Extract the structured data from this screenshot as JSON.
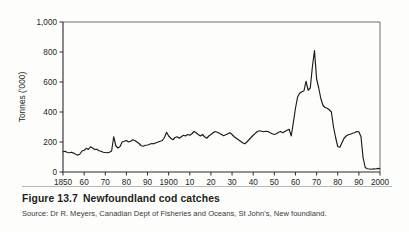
{
  "figure": {
    "number": "Figure 13.7",
    "title": "Newfoundland cod catches",
    "source": "Source: Dr R. Meyers, Canadian Dept of Fisheries and Oceans, St John's, New foundland."
  },
  "chart_data": {
    "type": "line",
    "title": "Newfoundland cod catches",
    "xlabel": "",
    "ylabel": "Tonnes ('000)",
    "xlim": [
      1850,
      2000
    ],
    "ylim": [
      0,
      1000
    ],
    "grid": false,
    "legend": null,
    "x_tick_values": [
      1850,
      1860,
      1870,
      1880,
      1890,
      1900,
      1910,
      1920,
      1930,
      1940,
      1950,
      1960,
      1970,
      1980,
      1990,
      2000
    ],
    "x_tick_labels": [
      "1850",
      "60",
      "70",
      "80",
      "90",
      "1900",
      "10",
      "20",
      "30",
      "40",
      "50",
      "60",
      "70",
      "80",
      "90",
      "2000"
    ],
    "y_tick_values": [
      0,
      200,
      400,
      600,
      800,
      1000
    ],
    "y_tick_labels": [
      "0",
      "200",
      "400",
      "600",
      "800",
      "1,000"
    ],
    "series": [
      {
        "name": "Newfoundland cod catch",
        "x": [
          1850,
          1851,
          1852,
          1853,
          1854,
          1855,
          1856,
          1857,
          1858,
          1859,
          1860,
          1861,
          1862,
          1863,
          1864,
          1865,
          1866,
          1867,
          1868,
          1869,
          1870,
          1871,
          1872,
          1873,
          1874,
          1875,
          1876,
          1877,
          1878,
          1879,
          1880,
          1881,
          1882,
          1883,
          1884,
          1885,
          1886,
          1887,
          1888,
          1889,
          1890,
          1891,
          1892,
          1893,
          1894,
          1895,
          1896,
          1897,
          1898,
          1899,
          1900,
          1901,
          1902,
          1903,
          1904,
          1905,
          1906,
          1907,
          1908,
          1909,
          1910,
          1911,
          1912,
          1913,
          1914,
          1915,
          1916,
          1917,
          1918,
          1919,
          1920,
          1921,
          1922,
          1923,
          1924,
          1925,
          1926,
          1927,
          1928,
          1929,
          1930,
          1931,
          1932,
          1933,
          1934,
          1935,
          1936,
          1937,
          1938,
          1939,
          1940,
          1941,
          1942,
          1943,
          1944,
          1945,
          1946,
          1947,
          1948,
          1949,
          1950,
          1951,
          1952,
          1953,
          1954,
          1955,
          1956,
          1957,
          1958,
          1959,
          1960,
          1961,
          1962,
          1963,
          1964,
          1965,
          1966,
          1967,
          1968,
          1969,
          1970,
          1971,
          1972,
          1973,
          1974,
          1975,
          1976,
          1977,
          1978,
          1979,
          1980,
          1981,
          1982,
          1983,
          1984,
          1985,
          1986,
          1987,
          1988,
          1989,
          1990,
          1991,
          1992,
          1993,
          1994,
          1995,
          1996,
          1997,
          1998,
          1999,
          2000
        ],
        "y": [
          135,
          138,
          130,
          128,
          132,
          126,
          118,
          112,
          120,
          140,
          145,
          158,
          150,
          168,
          160,
          150,
          152,
          142,
          138,
          132,
          130,
          128,
          132,
          140,
          235,
          175,
          160,
          170,
          200,
          205,
          210,
          200,
          205,
          215,
          210,
          200,
          190,
          175,
          172,
          178,
          180,
          185,
          190,
          188,
          195,
          200,
          205,
          210,
          230,
          265,
          240,
          225,
          215,
          230,
          235,
          225,
          235,
          245,
          240,
          250,
          245,
          255,
          270,
          262,
          250,
          240,
          250,
          235,
          225,
          240,
          250,
          262,
          270,
          265,
          258,
          250,
          242,
          248,
          255,
          262,
          250,
          235,
          225,
          215,
          205,
          195,
          188,
          200,
          215,
          230,
          245,
          258,
          270,
          275,
          272,
          268,
          272,
          270,
          262,
          255,
          250,
          255,
          265,
          270,
          262,
          270,
          278,
          285,
          240,
          330,
          425,
          500,
          525,
          535,
          540,
          605,
          545,
          560,
          700,
          810,
          620,
          560,
          490,
          445,
          430,
          425,
          415,
          400,
          300,
          230,
          170,
          165,
          195,
          225,
          240,
          248,
          252,
          258,
          262,
          270,
          268,
          235,
          95,
          30,
          22,
          20,
          18,
          22,
          20,
          24,
          22
        ]
      }
    ]
  }
}
